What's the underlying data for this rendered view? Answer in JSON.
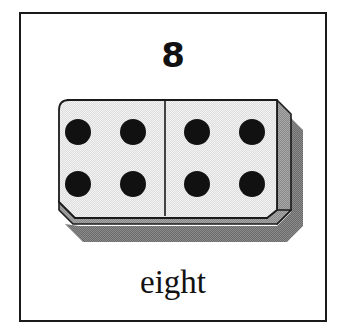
{
  "card": {
    "numeral": "8",
    "word": "eight",
    "frame_color": "#1a1a1a",
    "background_color": "#ffffff"
  },
  "domino": {
    "name": "domino-tile",
    "total_pips": 8,
    "face_color": "#ededed",
    "face_texture": "halftone-dither",
    "edge_color": "#1a1a1a",
    "side_face_color": "#9a9a9a",
    "bottom_face_color": "#a6a6a6",
    "drop_shadow_color": "#6e6e6e",
    "pip_color": "#111111",
    "divider_color": "#1a1a1a",
    "halves": [
      {
        "name": "left-half",
        "pip_count": 4,
        "pips": [
          {
            "cx": 33,
            "cy": 40
          },
          {
            "cx": 88,
            "cy": 40
          },
          {
            "cx": 33,
            "cy": 92
          },
          {
            "cx": 88,
            "cy": 92
          }
        ]
      },
      {
        "name": "right-half",
        "pip_count": 4,
        "pips": [
          {
            "cx": 137,
            "cy": 40
          },
          {
            "cx": 192,
            "cy": 40
          },
          {
            "cx": 137,
            "cy": 92
          },
          {
            "cx": 192,
            "cy": 92
          }
        ]
      }
    ],
    "pip_radius": 13,
    "divider_x": 120
  }
}
